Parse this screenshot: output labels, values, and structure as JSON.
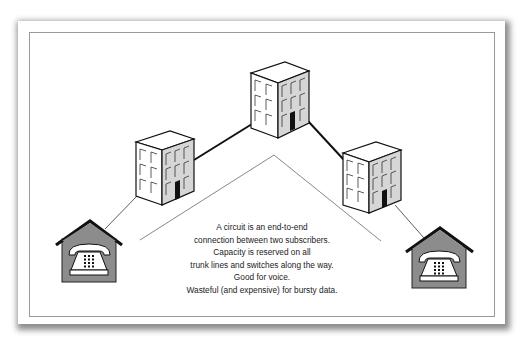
{
  "diagram": {
    "caption_lines": [
      "A circuit is an end-to-end",
      "connection between two subscribers.",
      "Capacity is reserved on all",
      "trunk lines and switches along the way.",
      "Good for voice.",
      "Wasteful (and expensive) for bursty data."
    ],
    "nodes": [
      {
        "id": "subscriber-left",
        "type": "house-telephone"
      },
      {
        "id": "switch-left",
        "type": "building"
      },
      {
        "id": "switch-center",
        "type": "building"
      },
      {
        "id": "switch-right",
        "type": "building"
      },
      {
        "id": "subscriber-right",
        "type": "house-telephone"
      }
    ],
    "links": [
      {
        "from": "subscriber-left",
        "to": "switch-left",
        "kind": "access-line"
      },
      {
        "from": "switch-left",
        "to": "switch-center",
        "kind": "trunk-line"
      },
      {
        "from": "switch-center",
        "to": "switch-right",
        "kind": "trunk-line"
      },
      {
        "from": "switch-right",
        "to": "subscriber-right",
        "kind": "access-line"
      }
    ],
    "colors": {
      "house_fill": "#8c8c8c",
      "building_side": "#d6d6d6",
      "building_front": "#ffffff",
      "line": "#111111",
      "chevron": "#7a7a7a"
    }
  }
}
